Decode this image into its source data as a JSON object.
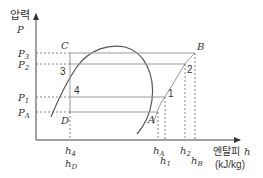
{
  "axes": {
    "y_label_korean": "압력",
    "y_label_symbol": "P",
    "x_label_korean": "엔탈피",
    "x_label_symbol": "h",
    "x_label_unit": "(kJ/kg)"
  },
  "pressure_labels": {
    "p3": {
      "base": "P",
      "sub": "3"
    },
    "p2": {
      "base": "P",
      "sub": "2"
    },
    "p1": {
      "base": "P",
      "sub": "1"
    },
    "pA": {
      "base": "P",
      "sub": "A"
    }
  },
  "enthalpy_labels": {
    "h4": {
      "base": "h",
      "sub": "4"
    },
    "hD": {
      "base": "h",
      "sub": "D"
    },
    "hA": {
      "base": "h",
      "sub": "A"
    },
    "h1": {
      "base": "h",
      "sub": "1"
    },
    "h2": {
      "base": "h",
      "sub": "2"
    },
    "hB": {
      "base": "h",
      "sub": "B"
    }
  },
  "points": {
    "C": "C",
    "B": "B",
    "D": "D",
    "A": "A",
    "p1": "1",
    "p2": "2",
    "p3": "3",
    "p4": "4"
  },
  "colors": {
    "line": "#555555",
    "cycle": "#999999",
    "text": "#333333"
  }
}
